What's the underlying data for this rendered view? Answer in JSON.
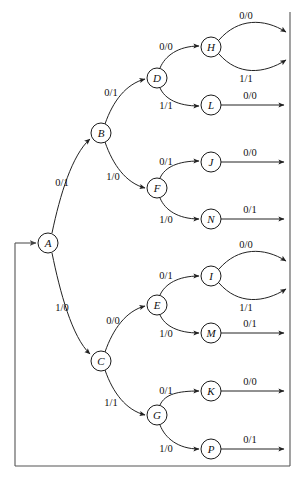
{
  "diagram": {
    "colors": {
      "background": "#ffffff",
      "stroke": "#222222",
      "bus_stroke": "#555555",
      "node_fill": "#ffffff",
      "text": "#111111"
    },
    "nodes": [
      {
        "id": "A",
        "label": "A",
        "cx": 48,
        "cy": 243,
        "r": 10
      },
      {
        "id": "B",
        "label": "B",
        "cx": 101,
        "cy": 133,
        "r": 10
      },
      {
        "id": "C",
        "label": "C",
        "cx": 101,
        "cy": 361,
        "r": 10
      },
      {
        "id": "D",
        "label": "D",
        "cx": 157,
        "cy": 78,
        "r": 10
      },
      {
        "id": "F",
        "label": "F",
        "cx": 157,
        "cy": 188,
        "r": 10
      },
      {
        "id": "E",
        "label": "E",
        "cx": 157,
        "cy": 305,
        "r": 10
      },
      {
        "id": "G",
        "label": "G",
        "cx": 157,
        "cy": 415,
        "r": 10
      },
      {
        "id": "H",
        "label": "H",
        "cx": 211,
        "cy": 47,
        "r": 10
      },
      {
        "id": "L",
        "label": "L",
        "cx": 211,
        "cy": 105,
        "r": 10
      },
      {
        "id": "J",
        "label": "J",
        "cx": 211,
        "cy": 162,
        "r": 10
      },
      {
        "id": "N",
        "label": "N",
        "cx": 211,
        "cy": 219,
        "r": 10
      },
      {
        "id": "I",
        "label": "I",
        "cx": 211,
        "cy": 276,
        "r": 10
      },
      {
        "id": "M",
        "label": "M",
        "cx": 211,
        "cy": 333,
        "r": 10
      },
      {
        "id": "K",
        "label": "K",
        "cx": 211,
        "cy": 391,
        "r": 10
      },
      {
        "id": "P",
        "label": "P",
        "cx": 211,
        "cy": 449,
        "r": 10
      }
    ],
    "edges": [
      {
        "id": "A-B",
        "from": "A",
        "to": "B",
        "label": "0/1",
        "lx": 62,
        "ly": 182
      },
      {
        "id": "A-C",
        "from": "A",
        "to": "C",
        "label": "1/0",
        "lx": 62,
        "ly": 307
      },
      {
        "id": "B-D",
        "from": "B",
        "to": "D",
        "label": "0/1",
        "lx": 111,
        "ly": 92
      },
      {
        "id": "B-F",
        "from": "B",
        "to": "F",
        "label": "1/0",
        "lx": 113,
        "ly": 176
      },
      {
        "id": "C-E",
        "from": "C",
        "to": "E",
        "label": "0/0",
        "lx": 113,
        "ly": 320
      },
      {
        "id": "C-G",
        "from": "C",
        "to": "G",
        "label": "1/1",
        "lx": 111,
        "ly": 402
      },
      {
        "id": "D-H",
        "from": "D",
        "to": "H",
        "label": "0/0",
        "lx": 166,
        "ly": 46
      },
      {
        "id": "D-L",
        "from": "D",
        "to": "L",
        "label": "1/1",
        "lx": 166,
        "ly": 105
      },
      {
        "id": "F-J",
        "from": "F",
        "to": "J",
        "label": "0/1",
        "lx": 166,
        "ly": 161
      },
      {
        "id": "F-N",
        "from": "F",
        "to": "N",
        "label": "1/0",
        "lx": 166,
        "ly": 219
      },
      {
        "id": "E-I",
        "from": "E",
        "to": "I",
        "label": "0/1",
        "lx": 166,
        "ly": 275
      },
      {
        "id": "E-M",
        "from": "E",
        "to": "M",
        "label": "1/0",
        "lx": 166,
        "ly": 333
      },
      {
        "id": "G-K",
        "from": "G",
        "to": "K",
        "label": "0/1",
        "lx": 166,
        "ly": 390
      },
      {
        "id": "G-P",
        "from": "G",
        "to": "P",
        "label": "1/0",
        "lx": 166,
        "ly": 448
      },
      {
        "id": "H-out0",
        "from": "H",
        "to": "bus",
        "label": "0/0",
        "lx": 246,
        "ly": 15
      },
      {
        "id": "H-out1",
        "from": "H",
        "to": "bus",
        "label": "1/1",
        "lx": 246,
        "ly": 78
      },
      {
        "id": "L-out",
        "from": "L",
        "to": "bus",
        "label": "0/0",
        "lx": 250,
        "ly": 95
      },
      {
        "id": "J-out",
        "from": "J",
        "to": "bus",
        "label": "0/0",
        "lx": 250,
        "ly": 152
      },
      {
        "id": "N-out",
        "from": "N",
        "to": "bus",
        "label": "0/1",
        "lx": 250,
        "ly": 209
      },
      {
        "id": "I-out0",
        "from": "I",
        "to": "bus",
        "label": "0/0",
        "lx": 246,
        "ly": 244
      },
      {
        "id": "I-out1",
        "from": "I",
        "to": "bus",
        "label": "1/1",
        "lx": 246,
        "ly": 307
      },
      {
        "id": "M-out",
        "from": "M",
        "to": "bus",
        "label": "0/1",
        "lx": 250,
        "ly": 323
      },
      {
        "id": "K-out",
        "from": "K",
        "to": "bus",
        "label": "0/0",
        "lx": 250,
        "ly": 381
      },
      {
        "id": "P-out",
        "from": "P",
        "to": "bus",
        "label": "0/1",
        "lx": 250,
        "ly": 439
      }
    ],
    "feedback": {
      "id": "bus-feedback",
      "description": "right vertical bus down to bottom, left along bottom, up into A"
    }
  }
}
